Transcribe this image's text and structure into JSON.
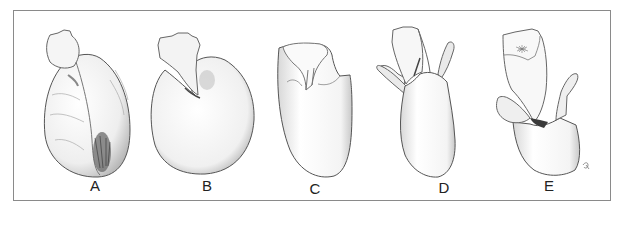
{
  "figure": {
    "panels": [
      {
        "id": "A",
        "label": "A",
        "x": 95,
        "y": 178
      },
      {
        "id": "B",
        "label": "B",
        "x": 207,
        "y": 178
      },
      {
        "id": "C",
        "label": "C",
        "x": 315,
        "y": 181
      },
      {
        "id": "D",
        "label": "D",
        "x": 444,
        "y": 180
      },
      {
        "id": "E",
        "label": "E",
        "x": 549,
        "y": 178
      }
    ],
    "signature": "R",
    "colors": {
      "stroke": "#555555",
      "shade": "#9a9a9a",
      "dark": "#3a3a3a",
      "frame": "#8a8a8a"
    }
  }
}
